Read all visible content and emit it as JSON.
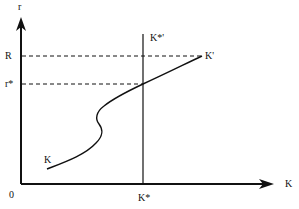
{
  "diagram": {
    "axes": {
      "y_label": "r",
      "x_label": "K",
      "origin_label": "0"
    },
    "y_ticks": [
      {
        "label": "R"
      },
      {
        "label": "r*"
      }
    ],
    "x_ticks": [
      {
        "label": "K*"
      }
    ],
    "vertical_line_label": "K*'",
    "curve": {
      "start_label": "K",
      "end_label": "K'"
    },
    "colors": {
      "line": "#111111",
      "background": "#ffffff"
    }
  }
}
